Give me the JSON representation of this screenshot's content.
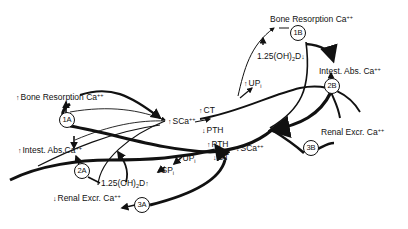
{
  "diagram": {
    "type": "calcium-homeostasis-feedback",
    "colors": {
      "line": "#111111",
      "background": "#ffffff"
    },
    "nodes": [
      {
        "id": "1A",
        "label": "1A"
      },
      {
        "id": "2A",
        "label": "2A"
      },
      {
        "id": "3A",
        "label": "3A"
      },
      {
        "id": "1B",
        "label": "1B"
      },
      {
        "id": "2B",
        "label": "2B"
      },
      {
        "id": "3B",
        "label": "3B"
      }
    ],
    "labels": {
      "bone_resorption_left": {
        "arrow": "↑",
        "text": "Bone Resorption Ca",
        "sup": "++"
      },
      "intest_abs_left": {
        "arrow": "↑",
        "text": "Intest. Abs.Ca",
        "sup": "++"
      },
      "renal_excr_left": {
        "arrow": "↓",
        "text": "Renal Excr. Ca",
        "sup": "++"
      },
      "bone_resorption_right": {
        "arrow": "",
        "text": "Bone Resorption Ca",
        "sup": "++"
      },
      "intest_abs_right": {
        "arrow": "",
        "text": "Intest. Abs. Ca",
        "sup": "++"
      },
      "renal_excr_right": {
        "arrow": "",
        "text": "Renal Excr. Ca",
        "sup": "++"
      },
      "sca_upper": {
        "arrow": "↑",
        "text": "SCa",
        "sup": "++"
      },
      "sca_lower": {
        "arrow": "↓",
        "text": "SCa",
        "sup": "++"
      },
      "ct_upper": {
        "arrow": "↑",
        "text": "CT"
      },
      "pth_upper": {
        "arrow": "↓",
        "text": "PTH"
      },
      "pth_lower": {
        "arrow": "↑",
        "text": "PTH"
      },
      "ct_lower": {
        "arrow": "↓",
        "text": "CT"
      },
      "up_upper": {
        "arrow": "↑",
        "text": "UP",
        "sub": "i"
      },
      "up_lower": {
        "arrow": "↓",
        "text": "UP",
        "sub": "i"
      },
      "sp_lower": {
        "arrow": "↓",
        "text": "SP",
        "sub": "i"
      },
      "vitd_upper": {
        "text": "1.25(OH)",
        "sub": "2",
        "text2": "D",
        "arrow_after": "↓"
      },
      "vitd_lower": {
        "text": "1.25(OH)",
        "sub": "2",
        "text2": "D",
        "arrow_after": "↑"
      }
    }
  }
}
